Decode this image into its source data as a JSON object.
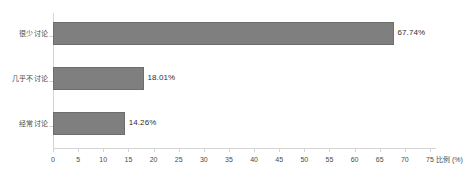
{
  "chart_data": {
    "type": "bar",
    "orientation": "horizontal",
    "title": "",
    "subtitle": "",
    "xlabel": "比例 (%)",
    "ylabel": "",
    "categories": [
      "很少讨论",
      "几乎不讨论",
      "经常讨论"
    ],
    "values": [
      67.74,
      18.01,
      14.26
    ],
    "data_labels": [
      "67.74%",
      "18.01%",
      "14.26%"
    ],
    "series": [
      {
        "name": "比例",
        "values": [
          67.74,
          18.01,
          14.26
        ]
      }
    ],
    "xlim": [
      0,
      75
    ],
    "xticks": [
      0,
      5,
      10,
      15,
      20,
      25,
      30,
      35,
      40,
      45,
      50,
      55,
      60,
      65,
      70,
      75
    ],
    "xticklabels": [
      "0",
      "5",
      "10",
      "15",
      "20",
      "25",
      "30",
      "35",
      "40",
      "45",
      "50",
      "55",
      "60",
      "65",
      "70",
      "75"
    ],
    "grid": false,
    "legend": false,
    "legend_position": "none",
    "bar_color": "#7f7f7f",
    "bar_border_color": "#6d6d6d",
    "axis_color": "#d4d4d4",
    "text_color": "#4a4a4a",
    "background": "#ffffff"
  }
}
